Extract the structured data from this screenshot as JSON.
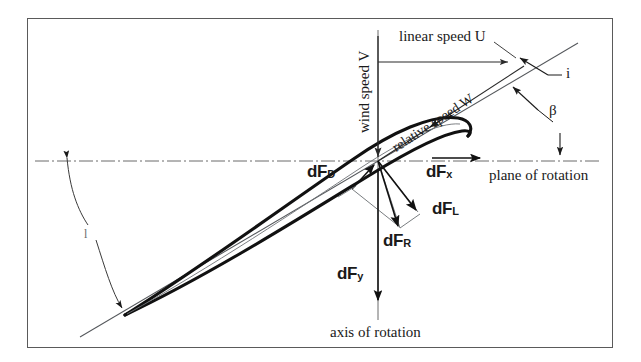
{
  "figure": {
    "domain": "diagram",
    "frame": {
      "stroke": "#5a5a5a"
    },
    "colors": {
      "ink": "#1a1a1a",
      "airfoil": "#111111",
      "construction": "#555555",
      "axis": "#6b6b6b",
      "background": "#ffffff"
    }
  },
  "labels": {
    "wind_speed": "wind speed V",
    "linear_speed": "linear speed U",
    "relative_speed": "relative speed W",
    "incidence_angle": "i",
    "beta_angle": "β",
    "pitch_angle": "l",
    "plane_of_rotation": "plane of rotation",
    "axis_of_rotation": "axis of rotation"
  },
  "forces": [
    {
      "key": "drag",
      "symbol": "dF",
      "subscript": "D",
      "name": "dF_D"
    },
    {
      "key": "tangential",
      "symbol": "dF",
      "subscript": "x",
      "name": "dF_x"
    },
    {
      "key": "lift",
      "symbol": "dF",
      "subscript": "L",
      "name": "dF_L"
    },
    {
      "key": "resultant",
      "symbol": "dF",
      "subscript": "R",
      "name": "dF_R"
    },
    {
      "key": "axial",
      "symbol": "dF",
      "subscript": "y",
      "name": "dF_y"
    }
  ],
  "geometry": {
    "origin": {
      "x": 378,
      "y": 161
    },
    "plane_of_rotation_line": {
      "x1": 35,
      "y1": 161,
      "x2": 600,
      "y2": 161
    },
    "axis_of_rotation_line": {
      "x1": 378,
      "y1": 30,
      "x2": 378,
      "y2": 320
    },
    "linear_speed_arrow": {
      "x1": 378,
      "y1": 62,
      "x2": 512,
      "y2": 62
    },
    "relative_speed_line": {
      "x1": 378,
      "y1": 161,
      "x2": 520,
      "y2": 68
    },
    "chord_line": {
      "x1": 108,
      "y1": 322,
      "x2": 560,
      "y2": 55
    },
    "airfoil_leading_edge": {
      "x": 462,
      "y": 126
    },
    "airfoil_trailing_edge": {
      "x": 125,
      "y": 315
    }
  }
}
